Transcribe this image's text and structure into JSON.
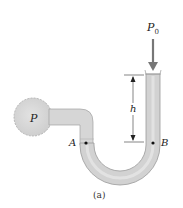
{
  "diagram": {
    "type": "U-tube manometer",
    "caption": "(a)",
    "labels": {
      "pressure_source": "P",
      "atmospheric": "P",
      "atmospheric_sub": "0",
      "height": "h",
      "point_a": "A",
      "point_b": "B"
    },
    "colors": {
      "fluid_fill": "#d4d4d4",
      "fluid_highlight": "#e8e8e8",
      "outline": "#9a9a9a",
      "arrow": "#777777",
      "text": "#222222"
    }
  }
}
